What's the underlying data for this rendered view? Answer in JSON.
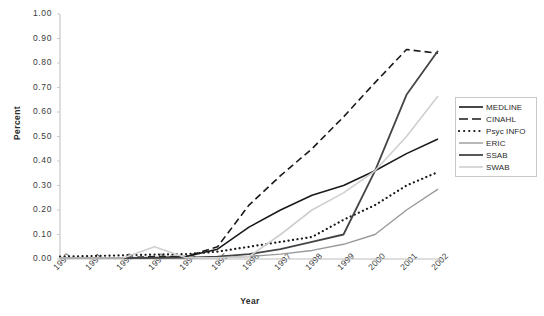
{
  "chart_data": {
    "type": "line",
    "title": "",
    "xlabel": "Year",
    "ylabel": "Percent",
    "xlim": [
      1990,
      2002
    ],
    "ylim": [
      0.0,
      1.0
    ],
    "grid": false,
    "legend_position": "right",
    "categories": [
      "1990",
      "1991",
      "1992",
      "1993",
      "1994",
      "1995",
      "1996",
      "1997",
      "1998",
      "1999",
      "2000",
      "2001",
      "2002"
    ],
    "ytick_labels": [
      "1.00",
      "0.90",
      "0.80",
      "0.70",
      "0.60",
      "0.50",
      "0.40",
      "0.30",
      "0.20",
      "0.10",
      "0.00"
    ],
    "ytick_values": [
      1.0,
      0.9,
      0.8,
      0.7,
      0.6,
      0.5,
      0.4,
      0.3,
      0.2,
      0.1,
      0.0
    ],
    "series": [
      {
        "name": "MEDLINE",
        "style": "solid",
        "color": "#1a1a1a",
        "width": 1.6,
        "values": [
          0.005,
          0.005,
          0.005,
          0.005,
          0.01,
          0.04,
          0.13,
          0.2,
          0.26,
          0.3,
          0.36,
          0.43,
          0.49
        ]
      },
      {
        "name": "CINAHL",
        "style": "dashed",
        "color": "#1a1a1a",
        "width": 1.6,
        "values": [
          0.005,
          0.005,
          0.005,
          0.01,
          0.01,
          0.05,
          0.22,
          0.34,
          0.45,
          0.58,
          0.72,
          0.855,
          0.84
        ]
      },
      {
        "name": "Psyc INFO",
        "style": "dotted",
        "color": "#1a1a1a",
        "width": 2.2,
        "values": [
          0.01,
          0.012,
          0.015,
          0.018,
          0.02,
          0.03,
          0.05,
          0.07,
          0.09,
          0.16,
          0.22,
          0.3,
          0.355
        ]
      },
      {
        "name": "ERIC",
        "style": "solid",
        "color": "#9a9a9a",
        "width": 1.4,
        "values": [
          0.003,
          0.003,
          0.003,
          0.004,
          0.005,
          0.006,
          0.01,
          0.02,
          0.035,
          0.06,
          0.1,
          0.2,
          0.285
        ]
      },
      {
        "name": "SSAB",
        "style": "solid",
        "color": "#454545",
        "width": 1.8,
        "values": [
          0.004,
          0.004,
          0.004,
          0.005,
          0.006,
          0.01,
          0.02,
          0.04,
          0.07,
          0.1,
          0.36,
          0.67,
          0.85
        ]
      },
      {
        "name": "SWAB",
        "style": "solid",
        "color": "#cfcfcf",
        "width": 1.6,
        "values": [
          0.004,
          0.004,
          0.004,
          0.05,
          0.005,
          0.005,
          0.01,
          0.1,
          0.2,
          0.27,
          0.36,
          0.5,
          0.665
        ]
      }
    ]
  },
  "legend": {
    "items": [
      {
        "label": "MEDLINE"
      },
      {
        "label": "CINAHL"
      },
      {
        "label": "Psyc INFO"
      },
      {
        "label": "ERIC"
      },
      {
        "label": "SSAB"
      },
      {
        "label": "SWAB"
      }
    ]
  }
}
